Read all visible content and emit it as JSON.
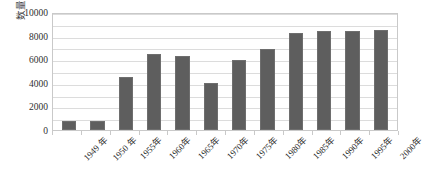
{
  "chart_data": {
    "type": "bar",
    "title": "",
    "xlabel": "",
    "ylabel": "数量/个",
    "categories": [
      "1949 年",
      "1950 年",
      "1955年",
      "1960年",
      "1965年",
      "1970年",
      "1975年",
      "1980年",
      "1985年",
      "1990年",
      "1995年",
      "2000年"
    ],
    "values": [
      800,
      800,
      4500,
      6400,
      6300,
      3950,
      5900,
      6850,
      8200,
      8400,
      8400,
      8500
    ],
    "series": [
      {
        "name": "数量",
        "values": [
          800,
          800,
          4500,
          6400,
          6300,
          3950,
          5900,
          6850,
          8200,
          8400,
          8400,
          8500
        ]
      }
    ],
    "ylim": [
      0,
      10000
    ],
    "y_ticks": [
      "0",
      "2000",
      "4000",
      "6000",
      "8000",
      "10000"
    ],
    "y_tick_values": [
      0,
      2000,
      4000,
      6000,
      8000,
      10000
    ],
    "y_minor_step": 1000,
    "grid": true,
    "grid_axis": "y",
    "legend": false,
    "legend_position": "none",
    "colors": {
      "bar_fill": "#5e5e5e",
      "bar_stroke": "#6e6e6e",
      "gridline": "#dcdcdc",
      "plot_border": "#c9c9c9",
      "text": "#2f2f2f",
      "background": "#ffffff"
    }
  }
}
